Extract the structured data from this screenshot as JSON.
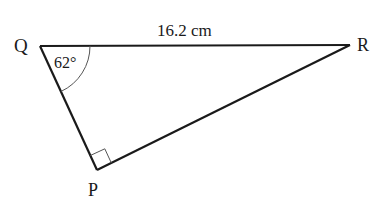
{
  "diagram": {
    "type": "right-triangle",
    "vertices": {
      "Q": {
        "label": "Q",
        "x": 40,
        "y": 46
      },
      "R": {
        "label": "R",
        "x": 350,
        "y": 45
      },
      "P": {
        "label": "P",
        "x": 97,
        "y": 170
      }
    },
    "sides": {
      "QR": {
        "label": "16.2 cm"
      }
    },
    "angles": {
      "Q": {
        "label": "62°",
        "value": 62
      },
      "P": {
        "right_angle": true
      }
    },
    "colors": {
      "line": "#1a1a1a",
      "arc": "#555555",
      "background": "#ffffff"
    }
  }
}
